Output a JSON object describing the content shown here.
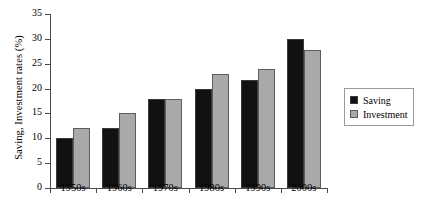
{
  "chart_data": {
    "type": "bar",
    "title": "",
    "subtitle": "",
    "xlabel": "",
    "ylabel": "Saving, Investment rates (%)",
    "categories": [
      "1950s",
      "1960s",
      "1970s",
      "1980s",
      "1990s",
      "2000s"
    ],
    "series": [
      {
        "name": "Saving",
        "color": "#111111",
        "values": [
          10,
          12,
          18,
          20,
          21.8,
          30
        ]
      },
      {
        "name": "Investment",
        "color": "#a9a9a9",
        "values": [
          12,
          15,
          18,
          23,
          24,
          27.8
        ]
      }
    ],
    "ylim": [
      0,
      35
    ],
    "ytick_labels": [
      "0",
      "5",
      "10",
      "15",
      "20",
      "25",
      "30",
      "35"
    ],
    "ytick_values": [
      0,
      5,
      10,
      15,
      20,
      25,
      30,
      35
    ],
    "grid": false,
    "legend_position": "right"
  },
  "legend": {
    "entries": [
      {
        "label": "Saving"
      },
      {
        "label": "Investment"
      }
    ]
  }
}
